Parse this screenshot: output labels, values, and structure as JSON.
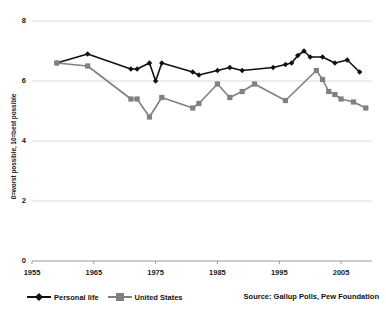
{
  "chart_data": {
    "type": "line",
    "title": "",
    "xlabel": "",
    "ylabel": "0=worst possible, 10=best possible",
    "xlim": [
      1955,
      2010
    ],
    "ylim": [
      0,
      8
    ],
    "xticks": [
      1955,
      1965,
      1975,
      1985,
      1995,
      2005
    ],
    "yticks": [
      0,
      2,
      4,
      6,
      8
    ],
    "grid": true,
    "legend_position": "bottom-left",
    "source": "Source: Gallup Polls, Pew Foundation",
    "series": [
      {
        "name": "Personal life",
        "color": "#111111",
        "marker": "diamond",
        "points": [
          {
            "x": 1959,
            "y": 6.6
          },
          {
            "x": 1964,
            "y": 6.9
          },
          {
            "x": 1971,
            "y": 6.4
          },
          {
            "x": 1972,
            "y": 6.4
          },
          {
            "x": 1974,
            "y": 6.6
          },
          {
            "x": 1975,
            "y": 6.0
          },
          {
            "x": 1976,
            "y": 6.6
          },
          {
            "x": 1981,
            "y": 6.3
          },
          {
            "x": 1982,
            "y": 6.2
          },
          {
            "x": 1985,
            "y": 6.35
          },
          {
            "x": 1987,
            "y": 6.45
          },
          {
            "x": 1989,
            "y": 6.35
          },
          {
            "x": 1994,
            "y": 6.45
          },
          {
            "x": 1996,
            "y": 6.55
          },
          {
            "x": 1997,
            "y": 6.6
          },
          {
            "x": 1998,
            "y": 6.85
          },
          {
            "x": 1999,
            "y": 7.0
          },
          {
            "x": 2000,
            "y": 6.8
          },
          {
            "x": 2002,
            "y": 6.8
          },
          {
            "x": 2004,
            "y": 6.6
          },
          {
            "x": 2006,
            "y": 6.7
          },
          {
            "x": 2008,
            "y": 6.3
          }
        ]
      },
      {
        "name": "United States",
        "color": "#808080",
        "marker": "square",
        "points": [
          {
            "x": 1959,
            "y": 6.6
          },
          {
            "x": 1964,
            "y": 6.5
          },
          {
            "x": 1971,
            "y": 5.4
          },
          {
            "x": 1972,
            "y": 5.4
          },
          {
            "x": 1974,
            "y": 4.8
          },
          {
            "x": 1976,
            "y": 5.45
          },
          {
            "x": 1981,
            "y": 5.1
          },
          {
            "x": 1982,
            "y": 5.25
          },
          {
            "x": 1985,
            "y": 5.9
          },
          {
            "x": 1987,
            "y": 5.45
          },
          {
            "x": 1989,
            "y": 5.65
          },
          {
            "x": 1991,
            "y": 5.9
          },
          {
            "x": 1996,
            "y": 5.35
          },
          {
            "x": 2001,
            "y": 6.35
          },
          {
            "x": 2002,
            "y": 6.05
          },
          {
            "x": 2003,
            "y": 5.65
          },
          {
            "x": 2004,
            "y": 5.55
          },
          {
            "x": 2005,
            "y": 5.4
          },
          {
            "x": 2007,
            "y": 5.3
          },
          {
            "x": 2009,
            "y": 5.1
          }
        ]
      }
    ]
  },
  "legend": {
    "items": [
      {
        "label": "Personal life"
      },
      {
        "label": "United States"
      }
    ]
  },
  "axes": {
    "y_tick_labels": [
      "8",
      "6",
      "4",
      "2",
      "0"
    ],
    "x_tick_labels": [
      "1955",
      "1965",
      "1975",
      "1985",
      "1995",
      "2005"
    ],
    "y_axis_title": "0=worst possible, 10=best possible"
  },
  "footer": {
    "source_text": "Source: Gallup Polls, Pew Foundation"
  }
}
